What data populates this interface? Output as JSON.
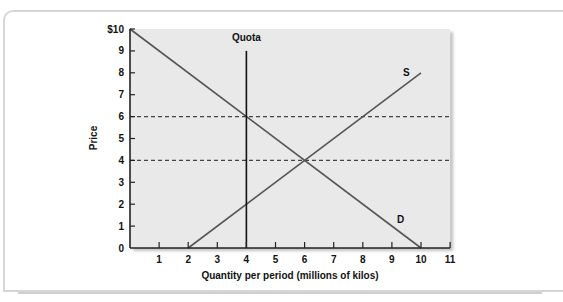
{
  "chart_data": {
    "type": "line",
    "title": "",
    "xlabel": "Quantity per period (millions of kilos)",
    "ylabel": "Price",
    "xlim": [
      0,
      11
    ],
    "ylim": [
      0,
      10
    ],
    "x_ticks": [
      "1",
      "2",
      "3",
      "4",
      "5",
      "6",
      "7",
      "8",
      "9",
      "10",
      "11"
    ],
    "y_ticks": [
      "0",
      "1",
      "2",
      "3",
      "4",
      "5",
      "6",
      "7",
      "8",
      "9",
      "$10"
    ],
    "grid": false,
    "legend": "none",
    "series": [
      {
        "name": "D",
        "label": "D",
        "points": [
          [
            0,
            10
          ],
          [
            10,
            0
          ]
        ],
        "style": "solid"
      },
      {
        "name": "S",
        "label": "S",
        "points": [
          [
            2,
            0
          ],
          [
            10,
            8
          ]
        ],
        "style": "solid"
      },
      {
        "name": "Quota",
        "label": "Quota",
        "points": [
          [
            4,
            0
          ],
          [
            4,
            9
          ]
        ],
        "style": "solid-vertical"
      },
      {
        "name": "Price 6",
        "label": "",
        "points": [
          [
            0,
            6
          ],
          [
            11,
            6
          ]
        ],
        "style": "dashed"
      },
      {
        "name": "Price 4",
        "label": "",
        "points": [
          [
            0,
            4
          ],
          [
            11,
            4
          ]
        ],
        "style": "dashed"
      }
    ],
    "annotations": [
      {
        "text": "Quota",
        "x": 4,
        "y": 9.6
      },
      {
        "text": "S",
        "x": 9.5,
        "y": 8
      },
      {
        "text": "D",
        "x": 9.3,
        "y": 1.3
      }
    ],
    "colors": {
      "plot_background": "#e9e9e9",
      "curve": "#555555",
      "quota": "#111111",
      "dashed": "#444444",
      "axis": "#222222"
    }
  }
}
